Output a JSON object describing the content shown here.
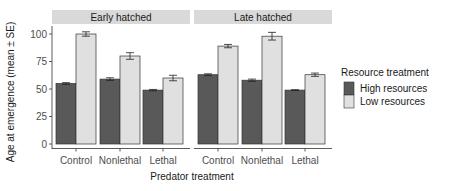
{
  "chart_data": {
    "type": "bar",
    "title": "",
    "xlabel": "Predator treatment",
    "ylabel": "Age at emergence (mean ± SE)",
    "ylim": [
      0,
      100
    ],
    "yticks": [
      0,
      25,
      50,
      75,
      100
    ],
    "categories": [
      "Control",
      "Nonlethal",
      "Lethal"
    ],
    "facets": [
      {
        "label": "Early hatched",
        "series": [
          {
            "name": "High resources",
            "values": [
              55,
              59,
              49
            ],
            "se": [
              0.8,
              1.2,
              0.6
            ]
          },
          {
            "name": "Low resources",
            "values": [
              100,
              80,
              60
            ],
            "se": [
              2,
              3,
              2.5
            ]
          }
        ]
      },
      {
        "label": "Late hatched",
        "series": [
          {
            "name": "High resources",
            "values": [
              63,
              58,
              49
            ],
            "se": [
              0.8,
              1,
              0.4
            ]
          },
          {
            "name": "Low resources",
            "values": [
              89,
              98,
              63
            ],
            "se": [
              1.5,
              3.5,
              1.5
            ]
          }
        ]
      }
    ],
    "legend": {
      "title": "Resource treatment",
      "position": "right",
      "entries": [
        {
          "label": "High resources",
          "color": "#595959"
        },
        {
          "label": "Low resources",
          "color": "#e0e0e0"
        }
      ]
    },
    "grid": false
  },
  "colors": {
    "high": "#595959",
    "low": "#e0e0e0",
    "strip": "#d9d9d9",
    "outline": "#333333"
  }
}
